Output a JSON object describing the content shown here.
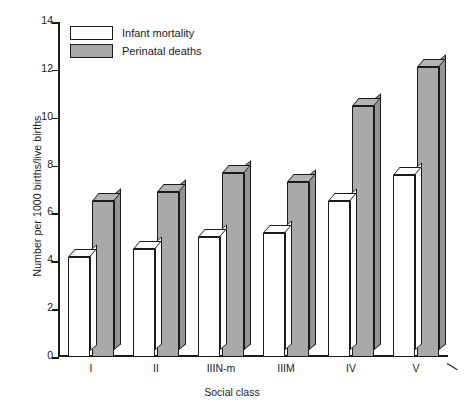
{
  "chart_data": {
    "type": "bar",
    "title": "",
    "xlabel": "Social class",
    "ylabel": "Number per 1000 births/live births",
    "categories": [
      "I",
      "II",
      "IIIN-m",
      "IIIM",
      "IV",
      "V"
    ],
    "series": [
      {
        "name": "Infant mortality",
        "color": "#ffffff",
        "values": [
          4.2,
          4.5,
          5.0,
          5.2,
          6.5,
          7.6
        ]
      },
      {
        "name": "Perinatal deaths",
        "color": "#a9a9a9",
        "values": [
          6.5,
          6.9,
          7.7,
          7.3,
          10.5,
          12.1
        ]
      }
    ],
    "ylim": [
      0,
      14
    ],
    "yticks": [
      0,
      2,
      4,
      6,
      8,
      10,
      12,
      14
    ],
    "ytick_labels": [
      "0",
      "2",
      "4",
      "6",
      "8",
      "10",
      "12",
      "14"
    ],
    "grid": false,
    "legend_position": "top-left",
    "style": "3d-bar"
  },
  "legend": {
    "items": [
      {
        "label": "Infant mortality",
        "swatch": "white"
      },
      {
        "label": "Perinatal deaths",
        "swatch": "gray"
      }
    ]
  },
  "axes": {
    "x_title": "Social class",
    "y_title": "Number per 1000 births/live births"
  }
}
